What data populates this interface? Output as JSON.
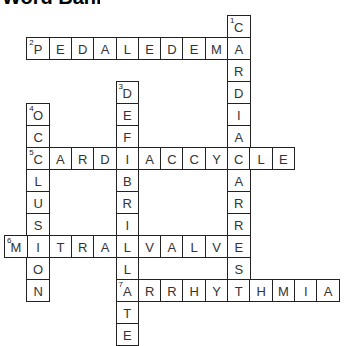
{
  "title": {
    "text": "Word Bank",
    "cropped": true
  },
  "grid": {
    "origin_x": 4,
    "origin_y": 15,
    "cell_w": 22.3,
    "cell_h": 22
  },
  "words": [
    {
      "number": "1",
      "direction": "down",
      "answer": "CARDIACARREST",
      "row": 0,
      "col": 10
    },
    {
      "number": "2",
      "direction": "across",
      "answer": "PEDALEDEMA",
      "row": 1,
      "col": 1
    },
    {
      "number": "3",
      "direction": "down",
      "answer": "DEFIBRILLATE",
      "row": 3,
      "col": 5
    },
    {
      "number": "4",
      "direction": "down",
      "answer": "OCCLUSION",
      "row": 4,
      "col": 1
    },
    {
      "number": "5",
      "direction": "across",
      "answer": "CARDIACCYCLE",
      "row": 6,
      "col": 1
    },
    {
      "number": "6",
      "direction": "across",
      "answer": "MITRALVALVE",
      "row": 10,
      "col": 0
    },
    {
      "number": "7",
      "direction": "across",
      "answer": "ARRHYTHMIA",
      "row": 12,
      "col": 5
    }
  ],
  "colors": {
    "border": "#222222",
    "text": "#333333",
    "background": "#ffffff"
  }
}
